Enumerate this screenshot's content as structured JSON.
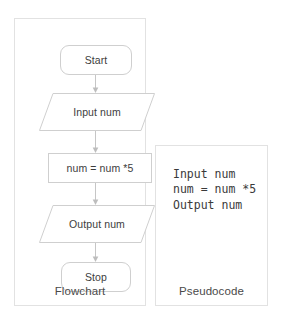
{
  "diagram": {
    "title_not_shown": "",
    "flowchart": {
      "caption": "Flowchart",
      "nodes": [
        {
          "id": "start",
          "shape": "terminator",
          "label": "Start"
        },
        {
          "id": "input",
          "shape": "parallelogram",
          "label": "Input num"
        },
        {
          "id": "process",
          "shape": "rectangle",
          "label": "num = num *5"
        },
        {
          "id": "output",
          "shape": "parallelogram",
          "label": "Output num"
        },
        {
          "id": "stop",
          "shape": "terminator",
          "label": "Stop"
        }
      ],
      "connectors": [
        {
          "from": "start",
          "to": "input",
          "arrow": "down-arrow-icon"
        },
        {
          "from": "input",
          "to": "process",
          "arrow": "down-arrow-icon"
        },
        {
          "from": "process",
          "to": "output",
          "arrow": "down-arrow-icon"
        },
        {
          "from": "output",
          "to": "stop",
          "arrow": "down-arrow-icon"
        }
      ]
    },
    "pseudocode": {
      "caption": "Pseudocode",
      "lines": [
        "Input num",
        "num = num *5",
        "Output num"
      ],
      "text": "Input num\nnum = num *5\nOutput num"
    },
    "colors": {
      "background": "#ffffff",
      "panel_border": "#e2e2e2",
      "node_border": "#cfcfcf",
      "text": "#3d3d3d",
      "connector": "#bdbdbd"
    }
  }
}
